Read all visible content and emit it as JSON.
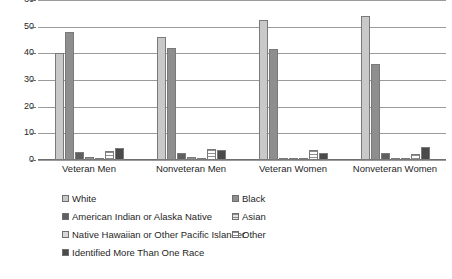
{
  "chart_data": {
    "type": "bar",
    "title": "",
    "subtitle": "",
    "xlabel": "",
    "ylabel": "",
    "ylim": [
      0,
      60
    ],
    "yticks": [
      0,
      10,
      20,
      30,
      40,
      50,
      60
    ],
    "grid": true,
    "legend_position": "bottom",
    "categories": [
      "Veteran Men",
      "Nonveteran Men",
      "Veteran Women",
      "Nonveteran Women"
    ],
    "series": [
      {
        "name": "White",
        "color": "#c9c9c9",
        "values": [
          40.0,
          46.0,
          52.5,
          54.0
        ]
      },
      {
        "name": "Black",
        "color": "#8e8e8e",
        "values": [
          48.0,
          42.0,
          41.5,
          36.0
        ]
      },
      {
        "name": "American Indian or Alaska Native",
        "color": "#5f5f5f",
        "values": [
          3.0,
          2.5,
          0.6,
          2.8
        ]
      },
      {
        "name": "Asian",
        "color": "#e2e2e2",
        "values": [
          1.0,
          1.0,
          0.4,
          0.6
        ]
      },
      {
        "name": "Native Hawaiian or Other Pacific Islander",
        "color": "#d8d8d8",
        "values": [
          0.8,
          0.8,
          0.3,
          0.7
        ]
      },
      {
        "name": "Other",
        "color": "#ffffff",
        "values": [
          3.2,
          4.2,
          3.6,
          2.4
        ]
      },
      {
        "name": "Identified More Than One Race",
        "color": "#4a4a4a",
        "values": [
          4.6,
          3.6,
          2.6,
          5.0
        ]
      }
    ],
    "legend_layout": [
      [
        "White",
        "Black"
      ],
      [
        "American Indian or Alaska Native",
        "Asian"
      ],
      [
        "Native Hawaiian or Other Pacific Islander",
        "Other"
      ],
      [
        "Identified More Than One Race",
        ""
      ]
    ]
  }
}
